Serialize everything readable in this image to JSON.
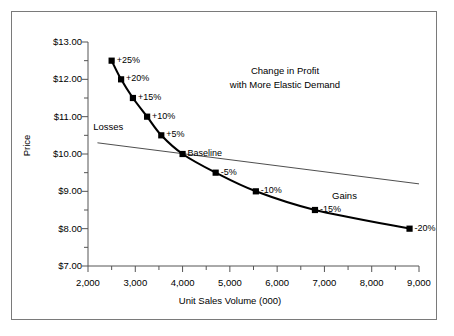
{
  "chart_data": {
    "type": "line",
    "title": "Change in Profit\nwith More Elastic Demand",
    "title_line1": "Change in Profit",
    "title_line2": "with More Elastic Demand",
    "xlabel": "Unit Sales Volume (000)",
    "ylabel": "Price",
    "xlim": [
      2000,
      9000
    ],
    "ylim": [
      7.0,
      13.0
    ],
    "xticks": [
      2000,
      3000,
      4000,
      5000,
      6000,
      7000,
      8000,
      9000
    ],
    "xtick_labels": [
      "2,000",
      "3,000",
      "4,000",
      "5,000",
      "6,000",
      "7,000",
      "8,000",
      "9,000"
    ],
    "xtick_minor_step": 500,
    "yticks": [
      7.0,
      8.0,
      9.0,
      10.0,
      11.0,
      12.0,
      13.0
    ],
    "ytick_labels": [
      "$7.00",
      "$8.00",
      "$9.00",
      "$10.00",
      "$11.00",
      "$12.00",
      "$13.00"
    ],
    "ytick_minor_step": 0.5,
    "grid": false,
    "legend": null,
    "series": [
      {
        "name": "Demand curve (more elastic)",
        "style": "thick-black-line-with-square-markers",
        "x": [
          2500,
          2700,
          2950,
          3250,
          3550,
          4000,
          4700,
          5550,
          6800,
          8800
        ],
        "y": [
          12.5,
          12.0,
          11.5,
          11.0,
          10.5,
          10.0,
          9.5,
          9.0,
          8.5,
          8.0
        ],
        "point_labels": [
          "+25%",
          "+20%",
          "+15%",
          "+10%",
          "+5%",
          "Baseline",
          "-5%",
          "-10%",
          "-15%",
          "-20%"
        ]
      },
      {
        "name": "Iso-profit baseline (thin line)",
        "style": "thin-black-line",
        "x": [
          2200,
          9000
        ],
        "y": [
          10.3,
          9.2
        ]
      }
    ],
    "annotations": [
      {
        "text": "Losses",
        "x": 2450,
        "y": 10.7
      },
      {
        "text": "Gains",
        "x": 7500,
        "y": 8.85
      }
    ]
  }
}
